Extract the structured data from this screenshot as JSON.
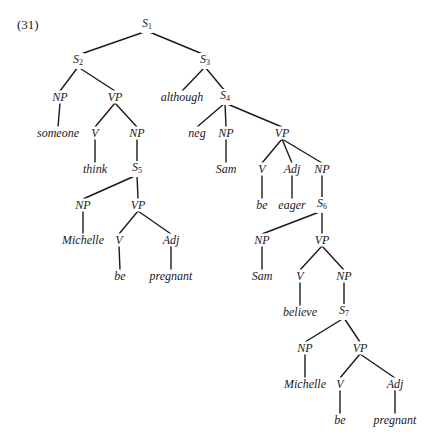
{
  "example_number": "(31)",
  "colors": {
    "ink": "#1a1a1a",
    "background": "#ffffff"
  },
  "nodes": [
    {
      "id": "s1",
      "label": "S",
      "sub": "1",
      "x": 147,
      "y": 25
    },
    {
      "id": "s2",
      "label": "S",
      "sub": "2",
      "x": 78,
      "y": 61
    },
    {
      "id": "s3",
      "label": "S",
      "sub": "3",
      "x": 205,
      "y": 61
    },
    {
      "id": "np1",
      "label": "NP",
      "x": 60,
      "y": 97
    },
    {
      "id": "vp1",
      "label": "VP",
      "x": 115,
      "y": 97
    },
    {
      "id": "although",
      "label": "although",
      "x": 182,
      "y": 97
    },
    {
      "id": "s4",
      "label": "S",
      "sub": "4",
      "x": 225,
      "y": 97
    },
    {
      "id": "someone",
      "label": "someone",
      "x": 58,
      "y": 133
    },
    {
      "id": "v1",
      "label": "V",
      "x": 95,
      "y": 133
    },
    {
      "id": "np2",
      "label": "NP",
      "x": 137,
      "y": 133
    },
    {
      "id": "neg",
      "label": "neg",
      "x": 197,
      "y": 133
    },
    {
      "id": "np3",
      "label": "NP",
      "x": 226,
      "y": 133
    },
    {
      "id": "vp2",
      "label": "VP",
      "x": 282,
      "y": 133
    },
    {
      "id": "think",
      "label": "think",
      "x": 95,
      "y": 169
    },
    {
      "id": "s5",
      "label": "S",
      "sub": "5",
      "x": 137,
      "y": 169
    },
    {
      "id": "sam1",
      "label": "Sam",
      "x": 226,
      "y": 169
    },
    {
      "id": "v2",
      "label": "V",
      "x": 262,
      "y": 169
    },
    {
      "id": "adj1",
      "label": "Adj",
      "x": 292,
      "y": 169
    },
    {
      "id": "np4",
      "label": "NP",
      "x": 322,
      "y": 169
    },
    {
      "id": "np5",
      "label": "NP",
      "x": 83,
      "y": 205
    },
    {
      "id": "vp3",
      "label": "VP",
      "x": 138,
      "y": 205
    },
    {
      "id": "be1",
      "label": "be",
      "x": 262,
      "y": 205
    },
    {
      "id": "eager",
      "label": "eager",
      "x": 292,
      "y": 205
    },
    {
      "id": "s6",
      "label": "S",
      "sub": "6",
      "x": 322,
      "y": 205
    },
    {
      "id": "michelle1",
      "label": "Michelle",
      "x": 83,
      "y": 240
    },
    {
      "id": "v3",
      "label": "V",
      "x": 119,
      "y": 240
    },
    {
      "id": "adj2",
      "label": "Adj",
      "x": 171,
      "y": 240
    },
    {
      "id": "np6",
      "label": "NP",
      "x": 262,
      "y": 240
    },
    {
      "id": "vp4",
      "label": "VP",
      "x": 322,
      "y": 240
    },
    {
      "id": "be2",
      "label": "be",
      "x": 120,
      "y": 276
    },
    {
      "id": "pregnant1",
      "label": "pregnant",
      "x": 171,
      "y": 276
    },
    {
      "id": "sam2",
      "label": "Sam",
      "x": 262,
      "y": 276
    },
    {
      "id": "v4",
      "label": "V",
      "x": 300,
      "y": 276
    },
    {
      "id": "np7",
      "label": "NP",
      "x": 344,
      "y": 276
    },
    {
      "id": "believe",
      "label": "believe",
      "x": 300,
      "y": 312
    },
    {
      "id": "s7",
      "label": "S",
      "sub": "7",
      "x": 344,
      "y": 312
    },
    {
      "id": "np8",
      "label": "NP",
      "x": 305,
      "y": 348
    },
    {
      "id": "vp5",
      "label": "VP",
      "x": 360,
      "y": 348
    },
    {
      "id": "michelle2",
      "label": "Michelle",
      "x": 305,
      "y": 384
    },
    {
      "id": "v5",
      "label": "V",
      "x": 340,
      "y": 384
    },
    {
      "id": "adj3",
      "label": "Adj",
      "x": 395,
      "y": 384
    },
    {
      "id": "be3",
      "label": "be",
      "x": 340,
      "y": 420
    },
    {
      "id": "pregnant2",
      "label": "pregnant",
      "x": 395,
      "y": 420
    }
  ],
  "edges": [
    [
      "s1",
      "s2"
    ],
    [
      "s1",
      "s3"
    ],
    [
      "s2",
      "np1"
    ],
    [
      "s2",
      "vp1"
    ],
    [
      "s3",
      "although"
    ],
    [
      "s3",
      "s4"
    ],
    [
      "np1",
      "someone"
    ],
    [
      "vp1",
      "v1"
    ],
    [
      "vp1",
      "np2"
    ],
    [
      "s4",
      "neg"
    ],
    [
      "s4",
      "np3"
    ],
    [
      "s4",
      "vp2"
    ],
    [
      "v1",
      "think"
    ],
    [
      "np2",
      "s5"
    ],
    [
      "np3",
      "sam1"
    ],
    [
      "vp2",
      "v2"
    ],
    [
      "vp2",
      "adj1"
    ],
    [
      "vp2",
      "np4"
    ],
    [
      "s5",
      "np5"
    ],
    [
      "s5",
      "vp3"
    ],
    [
      "v2",
      "be1"
    ],
    [
      "adj1",
      "eager"
    ],
    [
      "np4",
      "s6"
    ],
    [
      "np5",
      "michelle1"
    ],
    [
      "vp3",
      "v3"
    ],
    [
      "vp3",
      "adj2"
    ],
    [
      "s6",
      "np6"
    ],
    [
      "s6",
      "vp4"
    ],
    [
      "v3",
      "be2"
    ],
    [
      "adj2",
      "pregnant1"
    ],
    [
      "np6",
      "sam2"
    ],
    [
      "vp4",
      "v4"
    ],
    [
      "vp4",
      "np7"
    ],
    [
      "v4",
      "believe"
    ],
    [
      "np7",
      "s7"
    ],
    [
      "s7",
      "np8"
    ],
    [
      "s7",
      "vp5"
    ],
    [
      "np8",
      "michelle2"
    ],
    [
      "vp5",
      "v5"
    ],
    [
      "vp5",
      "adj3"
    ],
    [
      "v5",
      "be3"
    ],
    [
      "adj3",
      "pregnant2"
    ]
  ]
}
